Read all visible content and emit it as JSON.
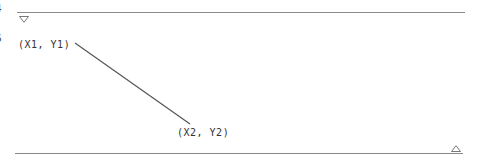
{
  "diagram": {
    "left_edge_fragments": [
      "4",
      "6"
    ],
    "point1": {
      "label": "(X1, Y1)"
    },
    "point2": {
      "label": "(X2, Y2)"
    },
    "top_marker": "down-triangle",
    "bottom_marker": "up-triangle",
    "colors": {
      "line": "#555555",
      "rule": "#8a8a8a",
      "text": "#333333"
    }
  }
}
